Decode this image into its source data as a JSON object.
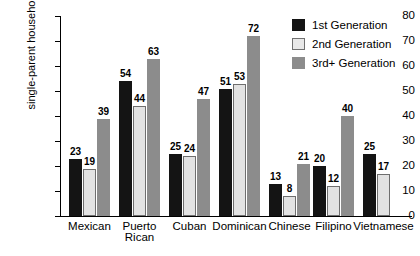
{
  "chart_data": {
    "type": "bar",
    "title": "",
    "xlabel": "",
    "ylabel": "single-parent households",
    "ylim": [
      0,
      80
    ],
    "ytick_step": 10,
    "yticks": [
      0,
      10,
      20,
      30,
      40,
      50,
      60,
      70,
      80
    ],
    "grid": false,
    "legend_position": "top-right",
    "categories": [
      "Mexican",
      "Puerto Rican",
      "Cuban",
      "Dominican",
      "Chinese",
      "Filipino",
      "Vietnamese"
    ],
    "series": [
      {
        "name": "1st Generation",
        "color": "#141414",
        "values": [
          23,
          54,
          25,
          51,
          13,
          20,
          25
        ]
      },
      {
        "name": "2nd Generation",
        "color": "#e2e2e2",
        "values": [
          19,
          44,
          24,
          53,
          8,
          12,
          17
        ]
      },
      {
        "name": "3rd+ Generation",
        "color": "#8c8c8c",
        "values": [
          39,
          63,
          47,
          72,
          21,
          40,
          null
        ]
      }
    ]
  },
  "legend": {
    "items": [
      {
        "label": "1st Generation"
      },
      {
        "label": "2nd Generation"
      },
      {
        "label": "3rd+ Generation"
      }
    ]
  },
  "axis": {
    "y_title": "single-parent households",
    "y_tick_labels": [
      "80",
      "70",
      "60",
      "50",
      "40",
      "30",
      "20",
      "10",
      "0"
    ],
    "x_tick_labels": [
      "Mexican",
      "Puerto\nRican",
      "Cuban",
      "Dominican",
      "Chinese",
      "Filipino",
      "Vietnamese"
    ]
  }
}
